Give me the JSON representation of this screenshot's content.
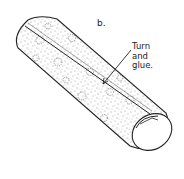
{
  "figure": {
    "letter": "b.",
    "callout_lines": [
      "Turn",
      "and",
      "glue."
    ]
  },
  "colors": {
    "ink": "#222222",
    "background": "#ffffff"
  }
}
